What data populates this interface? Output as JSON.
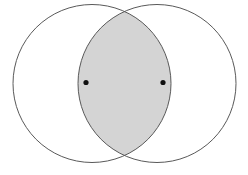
{
  "figure": {
    "name": "two-overlapping-circles-vesica-piscis",
    "width": 248,
    "height": 175,
    "background_color": "#ffffff",
    "title": "",
    "caption": "",
    "labels": []
  },
  "style": {
    "stroke_color": "#595959",
    "stroke_width": 1,
    "lens_fill_color": "#d4d4d4",
    "circle_fill_color": "#ffffff",
    "point_color": "#111111",
    "point_radius": 2.6
  },
  "chart_data": {
    "type": "diagram",
    "subtype": "venn-two-set-intersection",
    "title": "",
    "xlabel": "",
    "ylabel": "",
    "grid": false,
    "legend": "none",
    "xlim": [
      0,
      248
    ],
    "ylim": [
      0,
      175
    ],
    "shapes": [
      {
        "id": "circle-left",
        "kind": "circle",
        "cx": 92,
        "cy": 83.5,
        "r": 79,
        "fill": "none",
        "stroke": "#595959"
      },
      {
        "id": "circle-right",
        "kind": "circle",
        "cx": 157,
        "cy": 83.5,
        "r": 79,
        "fill": "none",
        "stroke": "#595959"
      },
      {
        "id": "lens-intersection",
        "kind": "lens",
        "fill": "#d4d4d4",
        "stroke": "#595959",
        "top_vertex": [
          124.5,
          14.5
        ],
        "bottom_vertex": [
          124.5,
          152.5
        ],
        "left_extreme": [
          78,
          83.5
        ],
        "right_extreme": [
          171,
          83.5
        ]
      }
    ],
    "points": [
      {
        "id": "point-left",
        "label": "",
        "x": 86,
        "y": 82.5,
        "color": "#111111"
      },
      {
        "id": "point-right",
        "label": "",
        "x": 163,
        "y": 82.5,
        "color": "#111111"
      }
    ]
  }
}
